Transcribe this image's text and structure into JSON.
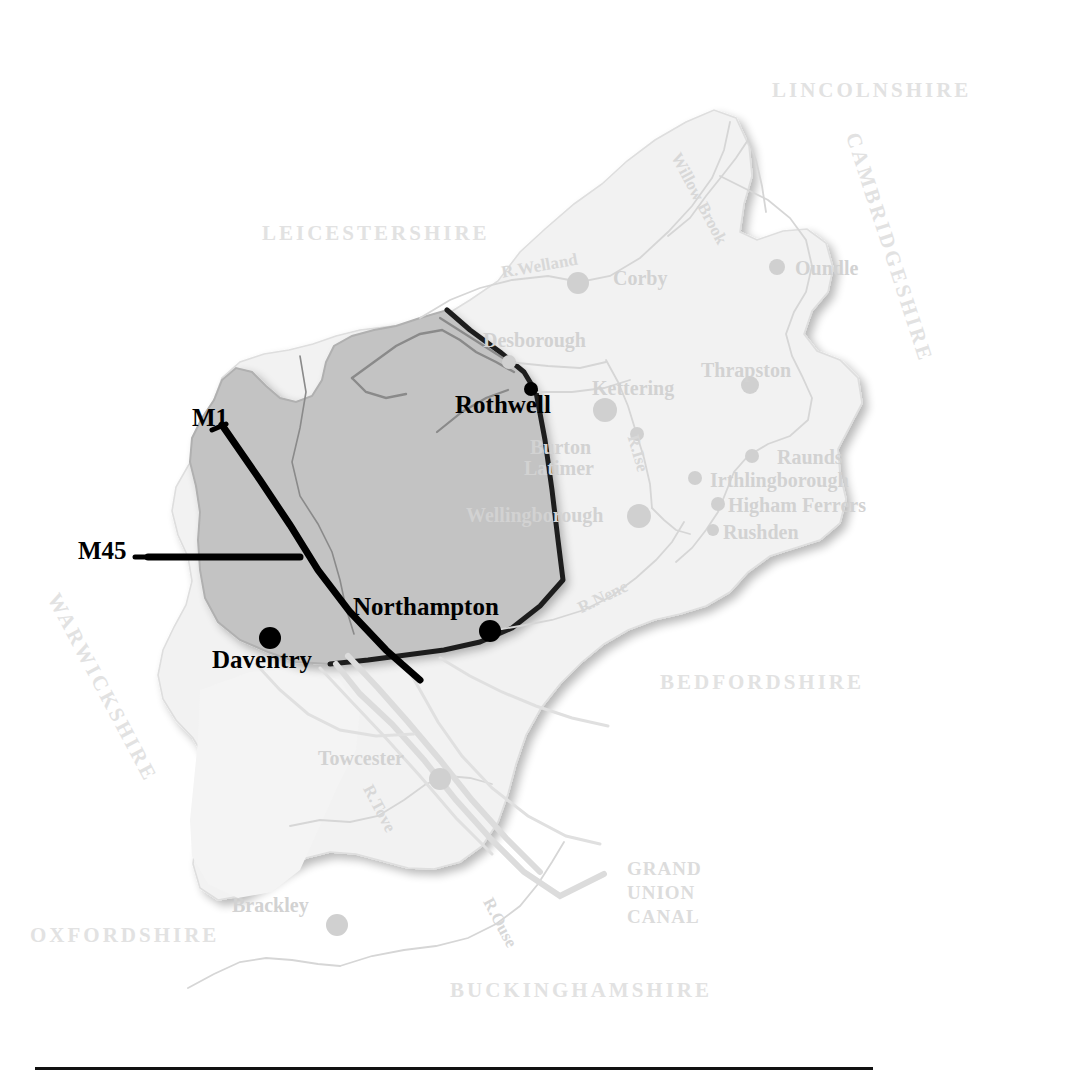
{
  "map": {
    "title_visible": false,
    "colors": {
      "background": "#ffffff",
      "county_fill": "#f2f2f2",
      "county_outline": "#dcdcdc",
      "highlight_fill": "#c3c3c3",
      "highlight_border": "#1a1a1a",
      "road_black": "#000000",
      "faint_text": "#e2e2e2",
      "town_text": "#d2d2d2",
      "key_text": "#000000",
      "river_line": "#d9d9d9",
      "canal_line": "#dddddd"
    },
    "neighbouring_counties": [
      {
        "name": "LINCOLNSHIRE",
        "x": 772,
        "y": 80,
        "rotate": 0
      },
      {
        "name": "CAMBRIDGESHIRE",
        "x": 862,
        "y": 130,
        "rotate": 72
      },
      {
        "name": "LEICESTERSHIRE",
        "x": 262,
        "y": 223,
        "rotate": 0
      },
      {
        "name": "BEDFORDSHIRE",
        "x": 660,
        "y": 672,
        "rotate": 0
      },
      {
        "name": "WARWICKSHIRE",
        "x": 62,
        "y": 590,
        "rotate": 62
      },
      {
        "name": "OXFORDSHIRE",
        "x": 30,
        "y": 925,
        "rotate": 0
      },
      {
        "name": "BUCKINGHAMSHIRE",
        "x": 450,
        "y": 980,
        "rotate": 0
      }
    ],
    "towns": [
      {
        "name": "Corby",
        "x": 613,
        "y": 268,
        "dot_x": 578,
        "dot_y": 283,
        "dot_r": 11,
        "size": "lg"
      },
      {
        "name": "Oundle",
        "x": 795,
        "y": 258,
        "dot_x": 777,
        "dot_y": 267,
        "dot_r": 8,
        "size": "lg"
      },
      {
        "name": "Desborough",
        "x": 483,
        "y": 330,
        "dot_x": 509,
        "dot_y": 362,
        "dot_r": 7,
        "size": "lg"
      },
      {
        "name": "Thrapston",
        "x": 701,
        "y": 360,
        "dot_x": 750,
        "dot_y": 385,
        "dot_r": 9,
        "size": "lg"
      },
      {
        "name": "Kettering",
        "x": 592,
        "y": 378,
        "dot_x": 605,
        "dot_y": 410,
        "dot_r": 12,
        "size": "lg"
      },
      {
        "name": "Burton",
        "x": 530,
        "y": 437,
        "dot_x": 637,
        "dot_y": 434,
        "dot_r": 7,
        "size": "lg"
      },
      {
        "name": "Latimer",
        "x": 524,
        "y": 458,
        "dot_x": -1,
        "dot_y": -1,
        "dot_r": 0,
        "size": "lg"
      },
      {
        "name": "Raunds",
        "x": 777,
        "y": 447,
        "dot_x": 752,
        "dot_y": 456,
        "dot_r": 7,
        "size": "lg"
      },
      {
        "name": "Irthlingborough",
        "x": 710,
        "y": 470,
        "dot_x": 695,
        "dot_y": 478,
        "dot_r": 7,
        "size": "lg"
      },
      {
        "name": "Higham Ferrers",
        "x": 728,
        "y": 495,
        "dot_x": 718,
        "dot_y": 504,
        "dot_r": 7,
        "size": "lg"
      },
      {
        "name": "Rushden",
        "x": 723,
        "y": 522,
        "dot_x": 713,
        "dot_y": 530,
        "dot_r": 6,
        "size": "lg"
      },
      {
        "name": "Wellingborough",
        "x": 466,
        "y": 505,
        "dot_x": 639,
        "dot_y": 516,
        "dot_r": 12,
        "size": "lg"
      },
      {
        "name": "Towcester",
        "x": 318,
        "y": 748,
        "dot_x": 440,
        "dot_y": 779,
        "dot_r": 11,
        "size": "lg"
      },
      {
        "name": "Brackley",
        "x": 232,
        "y": 895,
        "dot_x": 337,
        "dot_y": 925,
        "dot_r": 11,
        "size": "lg"
      }
    ],
    "key_places": [
      {
        "name": "Rothwell",
        "x": 455,
        "y": 392,
        "dot_x": 531,
        "dot_y": 389,
        "dot_r": 7,
        "anchor": "left"
      },
      {
        "name": "Northampton",
        "x": 353,
        "y": 594,
        "dot_x": 490,
        "dot_y": 631,
        "dot_r": 11,
        "anchor": "left"
      },
      {
        "name": "Daventry",
        "x": 212,
        "y": 647,
        "dot_x": 270,
        "dot_y": 638,
        "dot_r": 11,
        "anchor": "left"
      }
    ],
    "roads": [
      {
        "label": "M1",
        "x": 192,
        "y": 405,
        "line": "M 232,432 L 400,665"
      },
      {
        "label": "M45",
        "x": 78,
        "y": 538,
        "line": "M 150,557 L 300,557"
      }
    ],
    "rivers": [
      {
        "name": "R.Welland",
        "x": 500,
        "y": 264,
        "rotate": -10
      },
      {
        "name": "Willow Brook",
        "x": 683,
        "y": 150,
        "rotate": 62
      },
      {
        "name": "R.Ise",
        "x": 641,
        "y": 433,
        "rotate": 74
      },
      {
        "name": "R.Nene",
        "x": 575,
        "y": 601,
        "rotate": -26
      },
      {
        "name": "R.Tove",
        "x": 375,
        "y": 782,
        "rotate": 62
      },
      {
        "name": "R.Ouse",
        "x": 495,
        "y": 895,
        "rotate": 62
      }
    ],
    "canal": {
      "name_lines": [
        "GRAND",
        "UNION",
        "CANAL"
      ],
      "x": 627,
      "y": 857
    },
    "bottom_rule": {
      "x": 35,
      "y": 1068,
      "width": 838,
      "thickness": 3,
      "color": "#111111"
    }
  }
}
